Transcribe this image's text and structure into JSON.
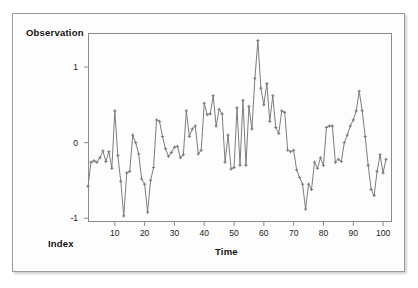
{
  "figure": {
    "background": "#fdfdfd",
    "border_color": "#9a9a9a"
  },
  "axis": {
    "y_title": "Observation",
    "x_title": "Time",
    "index_label": "Index",
    "line_color": "#8c8c8c"
  },
  "chart_data": {
    "type": "line",
    "title": "",
    "xlabel": "Time",
    "ylabel": "Observation",
    "series_color": "#7d7d7d",
    "marker": "plus",
    "grid": false,
    "legend": "none",
    "xlim": [
      1,
      103
    ],
    "ylim": [
      -1.05,
      1.45
    ],
    "xticks": [
      10,
      20,
      30,
      40,
      50,
      60,
      70,
      80,
      90,
      100
    ],
    "yticks": [
      -1,
      0,
      1
    ],
    "ytick_labels": [
      "-1",
      "0",
      "1"
    ],
    "xtick_labels": [
      "10",
      "20",
      "30",
      "40",
      "50",
      "60",
      "70",
      "80",
      "90",
      "100"
    ],
    "x": [
      1,
      2,
      3,
      4,
      5,
      6,
      7,
      8,
      9,
      10,
      11,
      12,
      13,
      14,
      15,
      16,
      17,
      18,
      19,
      20,
      21,
      22,
      23,
      24,
      25,
      26,
      27,
      28,
      29,
      30,
      31,
      32,
      33,
      34,
      35,
      36,
      37,
      38,
      39,
      40,
      41,
      42,
      43,
      44,
      45,
      46,
      47,
      48,
      49,
      50,
      51,
      52,
      53,
      54,
      55,
      56,
      57,
      58,
      59,
      60,
      61,
      62,
      63,
      64,
      65,
      66,
      67,
      68,
      69,
      70,
      71,
      72,
      73,
      74,
      75,
      76,
      77,
      78,
      79,
      80,
      81,
      82,
      83,
      84,
      85,
      86,
      87,
      88,
      89,
      90,
      91,
      92,
      93,
      94,
      95,
      96,
      97,
      98,
      99,
      100,
      101
    ],
    "values": [
      -0.58,
      -0.26,
      -0.24,
      -0.26,
      -0.2,
      -0.11,
      -0.25,
      -0.12,
      -0.34,
      0.42,
      -0.17,
      -0.51,
      -0.97,
      -0.4,
      -0.38,
      0.1,
      0.0,
      -0.15,
      -0.48,
      -0.55,
      -0.92,
      -0.5,
      -0.33,
      0.3,
      0.28,
      0.08,
      -0.08,
      -0.18,
      -0.13,
      -0.06,
      -0.05,
      -0.2,
      -0.16,
      0.42,
      0.08,
      0.18,
      0.22,
      -0.15,
      -0.1,
      0.52,
      0.37,
      0.38,
      0.62,
      0.22,
      0.44,
      0.38,
      -0.26,
      0.1,
      -0.35,
      -0.33,
      0.46,
      -0.3,
      0.56,
      -0.3,
      0.48,
      0.18,
      0.85,
      1.35,
      0.72,
      0.5,
      0.78,
      0.28,
      0.62,
      0.2,
      0.12,
      0.42,
      0.4,
      -0.1,
      -0.12,
      -0.1,
      -0.36,
      -0.46,
      -0.55,
      -0.88,
      -0.55,
      -0.62,
      -0.26,
      -0.34,
      -0.2,
      -0.3,
      0.2,
      0.22,
      0.22,
      -0.26,
      -0.22,
      -0.25,
      0.0,
      0.1,
      0.22,
      0.3,
      0.42,
      0.68,
      0.42,
      0.08,
      -0.3,
      -0.62,
      -0.7,
      -0.38,
      -0.16,
      -0.4,
      -0.22
    ]
  }
}
